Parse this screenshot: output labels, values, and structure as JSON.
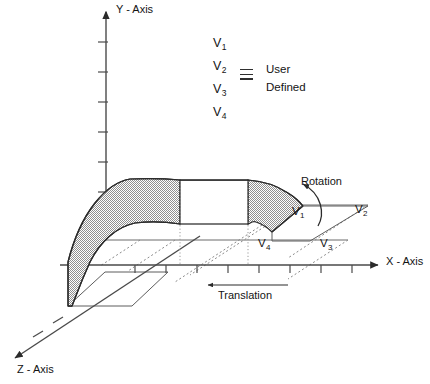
{
  "figure": {
    "type": "3d-swept-surface-diagram"
  },
  "axes": {
    "y": {
      "label": "Y - Axis",
      "tick_count": 6,
      "arrow": "up",
      "name": "y-axis"
    },
    "x": {
      "label": "X - Axis",
      "tick_count": 8,
      "arrow": "right",
      "name": "x-axis"
    },
    "z": {
      "label": "Z - Axis",
      "tick_count": 2,
      "arrow": "down-left",
      "name": "z-axis"
    }
  },
  "legend": {
    "vertices": [
      "V",
      "V",
      "V",
      "V"
    ],
    "vertex_labels": [
      {
        "base": "V",
        "sub": "1"
      },
      {
        "base": "V",
        "sub": "2"
      },
      {
        "base": "V",
        "sub": "3"
      },
      {
        "base": "V",
        "sub": "4"
      }
    ],
    "equivalence_symbol": "identical-to",
    "text_line1": "User",
    "text_line2": "Defined"
  },
  "annotations": {
    "rotation": {
      "label": "Rotation",
      "arrow": "curved-counterclockwise"
    },
    "translation": {
      "label": "Translation",
      "arrow": "left"
    }
  },
  "profile_vertices": [
    {
      "base": "V",
      "sub": "1",
      "position": "top-left"
    },
    {
      "base": "V",
      "sub": "2",
      "position": "top-right"
    },
    {
      "base": "V",
      "sub": "3",
      "position": "bottom-right"
    },
    {
      "base": "V",
      "sub": "4",
      "position": "bottom-left"
    }
  ],
  "colors": {
    "surface_fill": "#b8b8b8",
    "panel_fill": "#ffffff",
    "stroke": "#2b2b2b",
    "axis": "#4a4a4a",
    "background": "#ffffff"
  }
}
